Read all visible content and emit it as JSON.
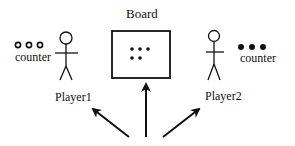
{
  "diagram": {
    "board": {
      "label": "Board",
      "pieces_top_row": 3,
      "pieces_bottom_row": 2
    },
    "player1": {
      "label": "Player1",
      "counter_label": "counter",
      "counter_style": "hollow",
      "counter_count": 3
    },
    "player2": {
      "label": "Player2",
      "counter_label": "counter",
      "counter_style": "filled",
      "counter_count": 3
    },
    "arrows": [
      {
        "target": "Player1",
        "direction": "up-left"
      },
      {
        "target": "Board",
        "direction": "up"
      },
      {
        "target": "Player2",
        "direction": "up-right"
      }
    ],
    "colors": {
      "stroke": "#111111",
      "background": "#ffffff"
    }
  }
}
